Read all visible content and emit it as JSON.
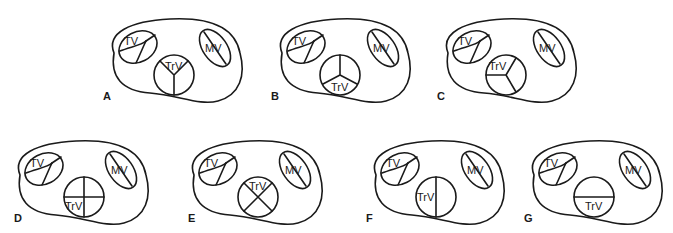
{
  "figure": {
    "valve_labels": {
      "tv": "TV",
      "mv": "MV",
      "trv": "TrV"
    },
    "panels": [
      {
        "id": "A",
        "label": "A",
        "truncal_config": "three leaflets, commissures at top-right, top-left and bottom (Y-shape inverted); TrV label in upper cusp"
      },
      {
        "id": "B",
        "label": "B",
        "truncal_config": "three leaflets, Y-shape with vertical commissure at top; TrV label in lower cusp"
      },
      {
        "id": "C",
        "label": "C",
        "truncal_config": "three leaflets, commissures at left, upper-right and lower-right; TrV label in upper-left cusp"
      },
      {
        "id": "D",
        "label": "D",
        "truncal_config": "four leaflets (quadricuspid), cross shape; TrV label in lower-left cusp"
      },
      {
        "id": "E",
        "label": "E",
        "truncal_config": "four leaflets, X shape; TrV label in upper cusp"
      },
      {
        "id": "F",
        "label": "F",
        "truncal_config": "two leaflets, vertical commissure; TrV label in left cusp"
      },
      {
        "id": "G",
        "label": "G",
        "truncal_config": "two leaflets, horizontal commissure; TrV label in lower cusp"
      }
    ]
  }
}
